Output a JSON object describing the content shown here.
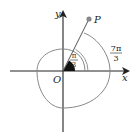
{
  "figure": {
    "type": "polar-angle-diagram",
    "axes": {
      "x_label": "x",
      "y_label": "y",
      "origin_label": "O"
    },
    "point": {
      "label": "P"
    },
    "angles": [
      {
        "name": "small-angle",
        "numerator": "π",
        "denominator": "3"
      },
      {
        "name": "large-angle",
        "numerator": "7π",
        "denominator": "3"
      }
    ],
    "colors": {
      "axis": "#222222",
      "curve": "#777777",
      "point": "#888888",
      "angle_fill": "#111111"
    }
  }
}
